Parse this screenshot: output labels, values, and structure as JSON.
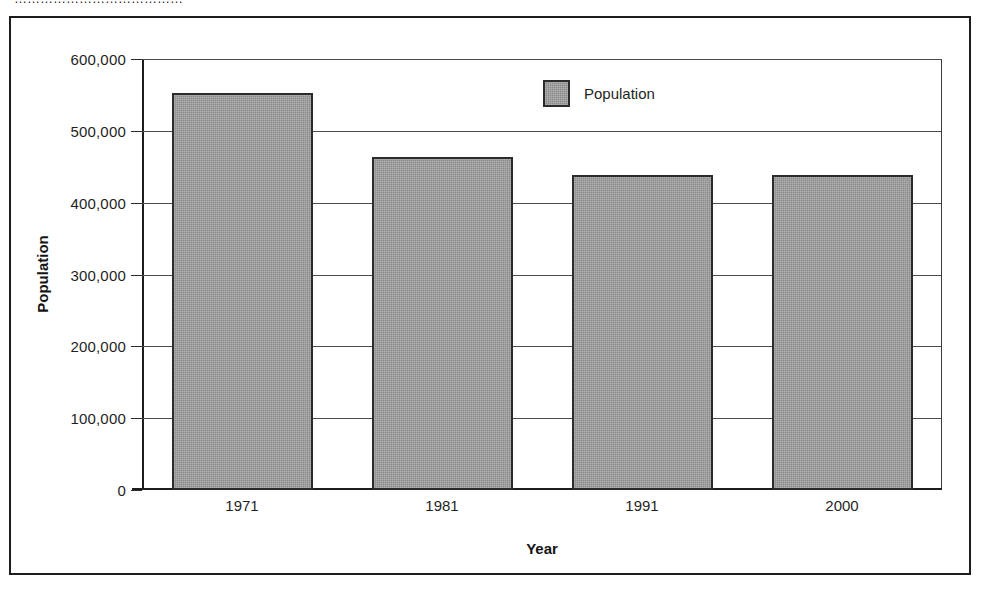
{
  "top_cut_text": "…………………………………",
  "legend": {
    "label": "Population",
    "swatch_color": "#8b8b8b"
  },
  "axes": {
    "y_title": "Population",
    "x_title": "Year",
    "y_ticks": [
      "600,000",
      "500,000",
      "400,000",
      "300,000",
      "200,000",
      "100,000",
      "0"
    ]
  },
  "chart_data": {
    "type": "bar",
    "title": "",
    "categories": [
      "1971",
      "1981",
      "1991",
      "2000"
    ],
    "values": [
      552000,
      463000,
      438000,
      438000
    ],
    "series": [
      {
        "name": "Population",
        "values": [
          552000,
          463000,
          438000,
          438000
        ]
      }
    ],
    "xlabel": "Year",
    "ylabel": "Population",
    "ylim": [
      0,
      600000
    ],
    "ytick_values": [
      0,
      100000,
      200000,
      300000,
      400000,
      500000,
      600000
    ],
    "grid": true,
    "legend_position": "top-center",
    "bar_color": "#8b8b8b",
    "bar_edge_color": "#2b2b2b"
  }
}
